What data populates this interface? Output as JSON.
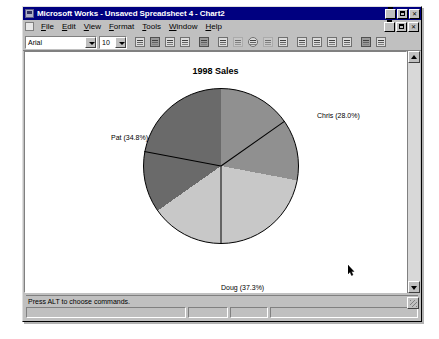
{
  "window": {
    "title": "Microsoft Works - Unsaved Spreadsheet 4 - Chart2",
    "app_icon": "works-app-icon",
    "minimize_label": "_",
    "maximize_label": "□",
    "close_label": "✕",
    "doc_icon": "document-icon"
  },
  "menu": {
    "items": [
      {
        "label": "File"
      },
      {
        "label": "Edit"
      },
      {
        "label": "View"
      },
      {
        "label": "Format"
      },
      {
        "label": "Tools"
      },
      {
        "label": "Window"
      },
      {
        "label": "Help"
      }
    ]
  },
  "toolbar": {
    "font_name": "Arial",
    "font_size": "10",
    "buttons": [
      {
        "name": "new-icon"
      },
      {
        "name": "save-icon"
      },
      {
        "name": "print-icon"
      },
      {
        "name": "print-preview-icon"
      },
      {
        "name": "cut-icon"
      },
      {
        "name": "bar-chart-icon"
      },
      {
        "name": "line-chart-icon"
      },
      {
        "name": "pie-chart-icon"
      },
      {
        "name": "area-chart-icon"
      },
      {
        "name": "scatter-chart-icon"
      },
      {
        "name": "stacked-chart-icon"
      },
      {
        "name": "combo-chart-icon"
      },
      {
        "name": "three-d-chart-icon"
      },
      {
        "name": "legend-icon"
      },
      {
        "name": "spreadsheet-icon"
      },
      {
        "name": "help-pointer-icon"
      }
    ]
  },
  "chart_data": {
    "type": "pie",
    "title": "1998 Sales",
    "xlabel": "",
    "ylabel": "",
    "legend_position": "none",
    "grid": false,
    "categories": [
      "Chris",
      "Doug",
      "Pat"
    ],
    "values": [
      28.0,
      37.3,
      34.8
    ],
    "labels": [
      {
        "text": "Chris (28.0%)",
        "name": "Chris",
        "percent": 28.0,
        "color": "#909090"
      },
      {
        "text": "Doug (37.3%)",
        "name": "Doug",
        "percent": 37.3,
        "color": "#c8c8c8"
      },
      {
        "text": "Pat (34.8%)",
        "name": "Pat",
        "percent": 34.8,
        "color": "#6a6a6a"
      }
    ],
    "slice_colors": [
      "#909090",
      "#c8c8c8",
      "#6a6a6a"
    ],
    "outline_color": "#000000",
    "background": "#ffffff"
  },
  "scrollbar": {
    "up_arrow": "scroll-up-arrow",
    "down_arrow": "scroll-down-arrow"
  },
  "statusbar": {
    "message": "Press ALT to choose commands.",
    "panels": [
      "",
      "",
      "",
      ""
    ]
  },
  "cursor": {
    "name": "mouse-pointer",
    "x": 345,
    "y": 268
  }
}
